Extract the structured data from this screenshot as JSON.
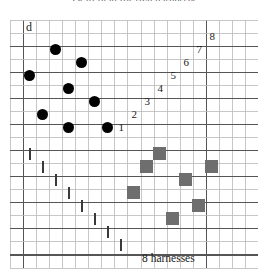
{
  "title": "Draft plan for five harnesses",
  "labels": {
    "draft_marker": "d",
    "harness_count": "8 harnesses"
  },
  "grid": {
    "cell_size": 13,
    "cols": 19,
    "rows": 19,
    "origin_x": 10,
    "origin_y": 17,
    "light_line_color": "#b9b9b9",
    "heavy_line_color": "#555555",
    "heavy_cols": [
      1,
      15
    ],
    "heavy_rows": [
      2,
      4,
      6,
      8,
      10,
      12,
      14,
      16,
      18
    ],
    "background": "#ffffff"
  },
  "colors": {
    "dot": "#000000",
    "square": "#6e6e6e",
    "tick": "#3a3a3a",
    "text": "#1c1c1c",
    "title": "#6b6b6b"
  },
  "threading_dots": [
    {
      "col": 3,
      "row": 2
    },
    {
      "col": 1,
      "row": 4
    },
    {
      "col": 5,
      "row": 3
    },
    {
      "col": 4,
      "row": 5
    },
    {
      "col": 2,
      "row": 7
    },
    {
      "col": 6,
      "row": 6
    },
    {
      "col": 4,
      "row": 8
    },
    {
      "col": 7,
      "row": 8
    }
  ],
  "step_numbers": [
    {
      "label": "1",
      "col": 8,
      "row": 8
    },
    {
      "label": "2",
      "col": 9,
      "row": 7
    },
    {
      "label": "3",
      "col": 10,
      "row": 6
    },
    {
      "label": "4",
      "col": 11,
      "row": 5
    },
    {
      "label": "5",
      "col": 12,
      "row": 4
    },
    {
      "label": "6",
      "col": 13,
      "row": 3
    },
    {
      "label": "7",
      "col": 14,
      "row": 2
    },
    {
      "label": "8",
      "col": 15,
      "row": 1
    }
  ],
  "treadling_ticks": [
    {
      "col": 1,
      "row": 10
    },
    {
      "col": 2,
      "row": 11
    },
    {
      "col": 3,
      "row": 12
    },
    {
      "col": 4,
      "row": 13
    },
    {
      "col": 5,
      "row": 14
    },
    {
      "col": 6,
      "row": 15
    },
    {
      "col": 7,
      "row": 16
    },
    {
      "col": 8,
      "row": 17
    }
  ],
  "tieup_squares": [
    {
      "col": 11,
      "row": 10
    },
    {
      "col": 10,
      "row": 11
    },
    {
      "col": 15,
      "row": 11
    },
    {
      "col": 13,
      "row": 12
    },
    {
      "col": 9,
      "row": 13
    },
    {
      "col": 14,
      "row": 14
    },
    {
      "col": 12,
      "row": 15
    }
  ]
}
